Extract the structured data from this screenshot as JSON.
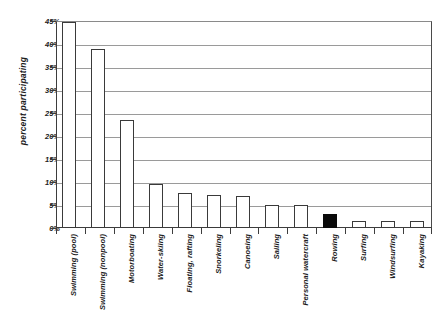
{
  "chart_data": {
    "type": "bar",
    "title": "",
    "xlabel": "",
    "ylabel": "percent participating",
    "ylim": [
      0,
      45
    ],
    "ytick_values": [
      0,
      5,
      10,
      15,
      20,
      25,
      30,
      35,
      40,
      45
    ],
    "ytick_labels": [
      "0%",
      "5%",
      "10%",
      "15%",
      "20%",
      "25%",
      "30%",
      "35%",
      "40%",
      "45%"
    ],
    "grid": true,
    "grid_axis": "y",
    "legend": false,
    "categories": [
      "Swimming (pool)",
      "Swimming (nonpool)",
      "Motorboating",
      "Water-skiing",
      "Floating, rafting",
      "Snorkeling",
      "Canoeing",
      "Sailing",
      "Personal watercraft",
      "Rowing",
      "Surfing",
      "Windsurfing",
      "Kayaking"
    ],
    "values": [
      44.8,
      39.0,
      23.5,
      9.5,
      7.6,
      7.2,
      7.0,
      5.0,
      5.0,
      3.0,
      1.5,
      1.5,
      1.5
    ],
    "bar_colors": [
      "#ffffff",
      "#ffffff",
      "#ffffff",
      "#ffffff",
      "#ffffff",
      "#ffffff",
      "#ffffff",
      "#ffffff",
      "#ffffff",
      "#0a0a0a",
      "#ffffff",
      "#ffffff",
      "#ffffff"
    ],
    "highlight_index": 9,
    "highlight_category": "Rowing",
    "bar_edge_color": "#3a3a3a",
    "axis_color": "#3d3d3d",
    "grid_color": "#9a9a9a",
    "background": "#ffffff"
  }
}
